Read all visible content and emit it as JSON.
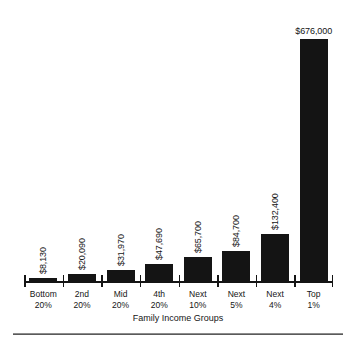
{
  "chart_data": {
    "type": "bar",
    "title": "",
    "subtitle": "",
    "xlabel": "Family Income Groups",
    "ylabel": "",
    "grid": false,
    "legend": "none",
    "orientation": "vertical",
    "bar_color": "#141414",
    "axis_color": "#141414",
    "value_label_rotation": "vertical (90°), except top bar horizontal",
    "ylim": [
      0,
      676000
    ],
    "categories": [
      "Bottom 20%",
      "2nd 20%",
      "Mid 20%",
      "4th 20%",
      "Next 10%",
      "Next 5%",
      "Next 4%",
      "Top 1%"
    ],
    "category_lines": [
      [
        "Bottom",
        "20%"
      ],
      [
        "2nd",
        "20%"
      ],
      [
        "Mid",
        "20%"
      ],
      [
        "4th",
        "20%"
      ],
      [
        "Next",
        "10%"
      ],
      [
        "Next",
        "5%"
      ],
      [
        "Next",
        "4%"
      ],
      [
        "Top",
        "1%"
      ]
    ],
    "values": [
      8130,
      20090,
      31970,
      47690,
      65700,
      84700,
      132400,
      676000
    ],
    "value_labels": [
      "$8,130",
      "$20,090",
      "$31,970",
      "$47,690",
      "$65,700",
      "$84,700",
      "$132,400",
      "$676,000"
    ]
  },
  "axis": {
    "tick_count": 9
  }
}
